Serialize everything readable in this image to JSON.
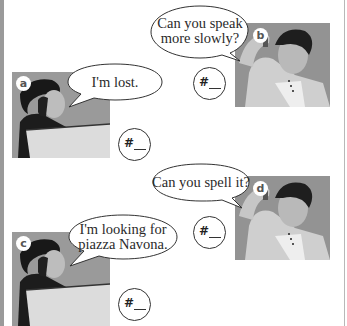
{
  "exercise": {
    "items": [
      {
        "label": "a",
        "speech": "I'm lost.",
        "answer_prefix": "#",
        "answer_value": ""
      },
      {
        "label": "b",
        "speech": "Can you speak\nmore slowly?",
        "answer_prefix": "#",
        "answer_value": ""
      },
      {
        "label": "c",
        "speech": "I'm looking for\npiazza Navona.",
        "answer_prefix": "#",
        "answer_value": ""
      },
      {
        "label": "d",
        "speech": "Can you spell it?",
        "answer_prefix": "#",
        "answer_value": ""
      }
    ]
  },
  "colors": {
    "border": "#9a9a9a",
    "photo_bg": "#8e8e8e",
    "text": "#2a2a2a"
  }
}
